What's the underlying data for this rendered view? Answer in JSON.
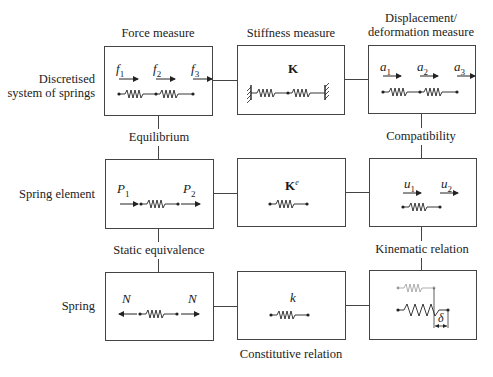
{
  "columns": {
    "force": "Force measure",
    "stiffness": "Stiffness measure",
    "displacement_line1": "Displacement/",
    "displacement_line2": "deformation measure"
  },
  "rows": {
    "discretised_line1": "Discretised",
    "discretised_line2": "system of springs",
    "spring_element": "Spring element",
    "spring": "Spring"
  },
  "relations": {
    "equilibrium": "Equilibrium",
    "compatibility": "Compatibility",
    "static_equivalence": "Static equivalence",
    "kinematic_relation": "Kinematic relation",
    "constitutive_relation": "Constitutive relation"
  },
  "boxes": {
    "r1c1": {
      "symbols": [
        {
          "base": "f",
          "sub": "1"
        },
        {
          "base": "f",
          "sub": "2"
        },
        {
          "base": "f",
          "sub": "3"
        }
      ]
    },
    "r1c2": {
      "symbol": "K"
    },
    "r1c3": {
      "symbols": [
        {
          "base": "a",
          "sub": "1"
        },
        {
          "base": "a",
          "sub": "2"
        },
        {
          "base": "a",
          "sub": "3"
        }
      ]
    },
    "r2c1": {
      "symbols": [
        {
          "base": "P",
          "sub": "1"
        },
        {
          "base": "P",
          "sub": "2"
        }
      ]
    },
    "r2c2": {
      "symbol": "K",
      "sup": "e"
    },
    "r2c3": {
      "symbols": [
        {
          "base": "u",
          "sub": "1"
        },
        {
          "base": "u",
          "sub": "2"
        }
      ]
    },
    "r3c1": {
      "symbols": [
        {
          "base": "N"
        },
        {
          "base": "N"
        }
      ]
    },
    "r3c2": {
      "symbol": "k"
    },
    "r3c3": {
      "symbol": "δ"
    }
  },
  "colors": {
    "line": "#444444",
    "ghost_spring": "#999999"
  }
}
